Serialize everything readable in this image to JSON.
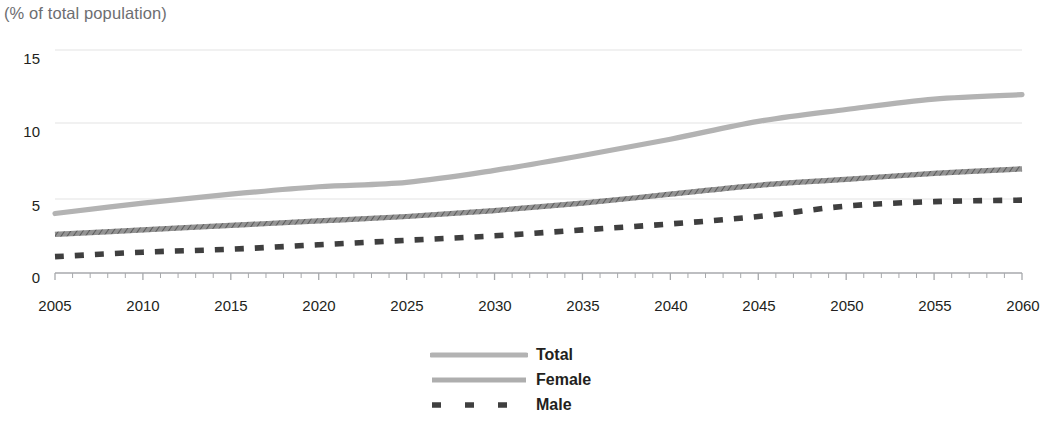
{
  "chart_data": {
    "type": "line",
    "title": "",
    "subtitle": "",
    "ylabel": "(% of total population)",
    "xlabel": "",
    "ylim": [
      0,
      15
    ],
    "xlim": [
      2005,
      2060
    ],
    "yticks": [
      0,
      5,
      10,
      15
    ],
    "xticks": [
      2005,
      2010,
      2015,
      2020,
      2025,
      2030,
      2035,
      2040,
      2045,
      2050,
      2055,
      2060
    ],
    "minor_xtick_interval": 1,
    "grid": "horizontal",
    "legend_position": "bottom-center",
    "x": [
      2005,
      2010,
      2015,
      2020,
      2025,
      2030,
      2035,
      2040,
      2045,
      2050,
      2055,
      2060
    ],
    "series": [
      {
        "name": "Total",
        "color": "#b3b3b3",
        "style": "solid",
        "values": [
          4.0,
          4.7,
          5.3,
          5.8,
          6.1,
          6.9,
          7.9,
          9.0,
          10.2,
          11.0,
          11.7,
          12.0
        ]
      },
      {
        "name": "Female",
        "color": "#3f3f3f",
        "style": "solid-hatched",
        "values": [
          2.6,
          2.9,
          3.2,
          3.5,
          3.8,
          4.2,
          4.7,
          5.3,
          5.9,
          6.3,
          6.7,
          7.0
        ]
      },
      {
        "name": "Male",
        "color": "#3f3f3f",
        "style": "dashed",
        "values": [
          1.1,
          1.4,
          1.6,
          1.9,
          2.2,
          2.5,
          2.9,
          3.3,
          3.8,
          4.5,
          4.8,
          4.9
        ]
      }
    ]
  },
  "axis": {
    "y_title": "(% of total population)",
    "yticks": [
      "15",
      "10",
      "5",
      "0"
    ],
    "xticks": [
      "2005",
      "2010",
      "2015",
      "2020",
      "2025",
      "2030",
      "2035",
      "2040",
      "2045",
      "2050",
      "2055",
      "2060"
    ]
  },
  "legend": {
    "items": [
      {
        "label": "Total"
      },
      {
        "label": "Female"
      },
      {
        "label": "Male"
      }
    ]
  },
  "colors": {
    "total": "#b3b3b3",
    "female": "#3f3f3f",
    "male": "#3f3f3f",
    "gridline": "#e4e4e4",
    "axis_text": "#231f20",
    "axis_title_text": "#6d6e71"
  }
}
